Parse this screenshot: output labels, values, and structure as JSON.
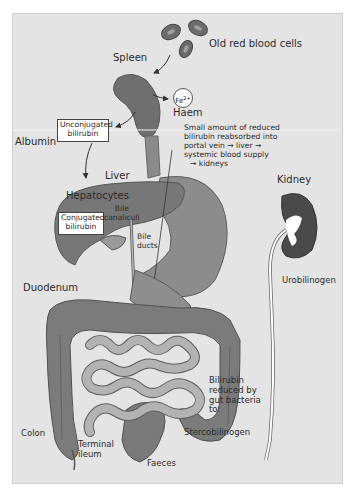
{
  "diagram": {
    "colors": {
      "background": "#e4e4e4",
      "organ_dark": "#6f6f6f",
      "organ_mid": "#8a8a8a",
      "organ_light": "#a5a5a5",
      "small_intestine": "#b3b3b3",
      "kidney": "#4a4a4a",
      "label_box": "#ffffff",
      "text": "#2a2a2a"
    },
    "labels": {
      "old_rbc": "Old red blood cells",
      "spleen": "Spleen",
      "fe": "Fe",
      "fe_charge": "2+",
      "haem": "Haem",
      "albumin": "Albumin",
      "unconjugated_1": "Unconjugated",
      "unconjugated_2": "bilirubin",
      "liver": "Liver",
      "hepatocytes": "Hepatocytes",
      "conjugated_1": "Conjugated",
      "conjugated_2": "bilirubin",
      "bile_canaliculi_1": "Bile",
      "bile_canaliculi_2": "canaliculi",
      "bile_ducts_1": "Bile",
      "bile_ducts_2": "ducts",
      "reabsorbed_1": "Small amount of reduced",
      "reabsorbed_2": "bilirubin reabsorbed into",
      "reabsorbed_3": "portal vein → liver →",
      "reabsorbed_4": "systemic blood supply",
      "reabsorbed_5": "→ kidneys",
      "kidney": "Kidney",
      "urobilinogen": "Urobilinogen",
      "duodenum": "Duodenum",
      "bilirubin_reduced_1": "Bilirubin",
      "bilirubin_reduced_2": "reduced by",
      "bilirubin_reduced_3": "gut bacteria",
      "bilirubin_reduced_4": "to:",
      "stercobilinogen": "Stercobilinogen",
      "colon": "Colon",
      "terminal_ileum_1": "Terminal",
      "terminal_ileum_2": "ileum",
      "faeces": "Faeces"
    }
  }
}
